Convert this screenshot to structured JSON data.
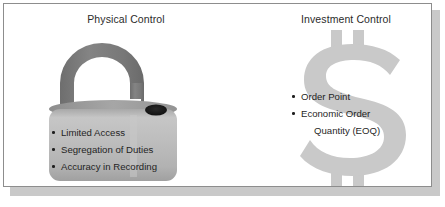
{
  "slide": {
    "background_color": "#ffffff",
    "frame_border_color": "#8d8d8d",
    "shadow_color": "#c9c9c9"
  },
  "columns": [
    {
      "id": "physical-control",
      "title": "Physical Control",
      "graphic": {
        "icon": "open-padlock-icon",
        "shackle_color": "#7d7d7d",
        "body_color": "#b8b8b8",
        "body_top_color": "#9a9a9a",
        "keyhole_color": "#1a1a1a"
      },
      "bullets": [
        "Limited Access",
        "Segregation of Duties",
        "Accuracy in Recording"
      ]
    },
    {
      "id": "investment-control",
      "title": "Investment Control",
      "graphic": {
        "icon": "dollar-sign-icon",
        "color": "#c9c9c9"
      },
      "bullets": [
        {
          "text": "Order Point",
          "marker": true
        },
        {
          "text": "Economic Order",
          "marker": true
        },
        {
          "text": "Quantity (EOQ)",
          "marker": false
        }
      ]
    }
  ]
}
